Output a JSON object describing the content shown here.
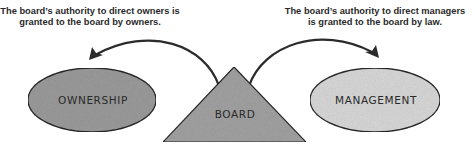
{
  "captions": {
    "left": {
      "line1": "The board’s authority to direct owners is",
      "line2": "granted to the board by owners."
    },
    "right": {
      "line1": "The board’s authority to direct managers",
      "line2": "is granted to the board by law."
    }
  },
  "nodes": {
    "ownership": {
      "label": "OWNERSHIP",
      "fill": "#9c9c9c"
    },
    "board": {
      "label": "BOARD",
      "fill": "#a3a3a3"
    },
    "management": {
      "label": "MANAGEMENT",
      "fill": "#d9d9d9"
    }
  },
  "colors": {
    "stroke": "#2b2b2b",
    "text": "#2a2a2a",
    "background": "#ffffff"
  },
  "arrows": [
    {
      "from": "BOARD",
      "to": "OWNERSHIP"
    },
    {
      "from": "BOARD",
      "to": "MANAGEMENT"
    }
  ]
}
